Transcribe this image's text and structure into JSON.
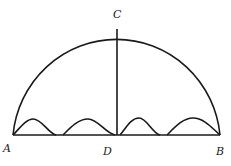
{
  "diagram": {
    "type": "semicircle with perpendicular and arches",
    "labels": {
      "A": "A",
      "B": "B",
      "C": "C",
      "D": "D"
    },
    "colors": {
      "stroke": "#1a1a1a",
      "label": "#222222",
      "background": "#ffffff"
    }
  }
}
